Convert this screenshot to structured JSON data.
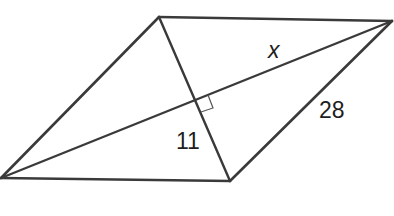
{
  "figure": {
    "type": "rhombus-with-diagonals",
    "background": "#ffffff",
    "line_color": "#3a3a3a",
    "vertices": {
      "top_left": [
        159,
        17
      ],
      "top_right": [
        392,
        21
      ],
      "bottom_right": [
        230,
        181
      ],
      "bottom_left": [
        1,
        178
      ]
    },
    "diagonals": [
      {
        "name": "long-diagonal",
        "from": "bottom_left",
        "to": "top_right"
      },
      {
        "name": "short-diagonal",
        "from": "top_left",
        "to": "bottom_right"
      }
    ],
    "right_angle_marker": {
      "at": "diagonal-intersection",
      "points": "208,95 213,108 201,112"
    },
    "labels": {
      "x": "x",
      "half_short_diagonal": "11",
      "side": "28"
    }
  }
}
